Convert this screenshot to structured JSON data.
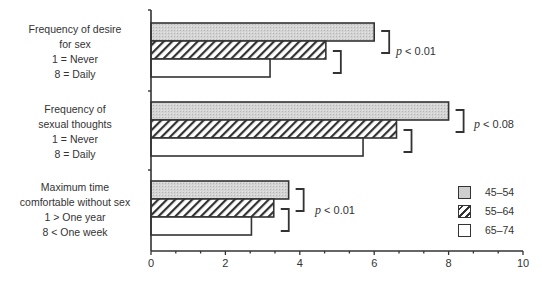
{
  "chart_data": {
    "type": "bar",
    "orientation": "horizontal",
    "title": "",
    "xlabel": "",
    "ylabel": "",
    "xlim": [
      0,
      10
    ],
    "x_ticks": [
      "0",
      "2",
      "4",
      "6",
      "8",
      "10"
    ],
    "categories": [
      "Frequency of desire for sex (1 = Never, 8 = Daily)",
      "Frequency of sexual thoughts (1 = Never, 8 = Daily)",
      "Maximum time comfortable without sex (1 > One year, 8 < One week)"
    ],
    "series": [
      {
        "name": "45–54",
        "fill": "gray",
        "values": [
          6.0,
          8.0,
          3.7
        ]
      },
      {
        "name": "55–64",
        "fill": "hatched",
        "values": [
          4.7,
          6.6,
          3.3
        ]
      },
      {
        "name": "65–74",
        "fill": "white",
        "values": [
          3.2,
          5.7,
          2.7
        ]
      }
    ],
    "annotations": [
      "p<0.01",
      "p<0.08",
      "p<0.01"
    ],
    "legend_position": "lower right",
    "grid": false
  },
  "categories": [
    {
      "lines": [
        "Frequency of desire",
        "for sex",
        "1 = Never",
        "8 = Daily"
      ]
    },
    {
      "lines": [
        "Frequency of",
        "sexual thoughts",
        "1 = Never",
        "8 = Daily"
      ]
    },
    {
      "lines": [
        "Maximum time",
        "comfortable without sex",
        "1 > One year",
        "8 < One week"
      ]
    }
  ],
  "ticks": [
    "0",
    "2",
    "4",
    "6",
    "8",
    "10"
  ],
  "pvalues": [
    {
      "p": "p",
      "rest": " < 0.01"
    },
    {
      "p": "p",
      "rest": " < 0.08"
    },
    {
      "p": "p",
      "rest": " < 0.01"
    }
  ],
  "legend": [
    "45–54",
    "55–64",
    "65–74"
  ],
  "colors": {
    "axis": "#333333",
    "gray_fill": "#cfcfcf",
    "hatch": "#333333"
  }
}
